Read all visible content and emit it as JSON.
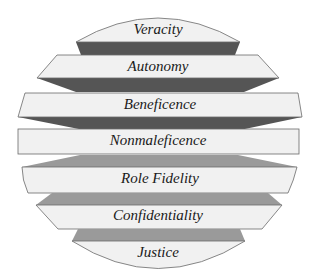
{
  "diagram": {
    "layers": [
      {
        "id": "veracity",
        "label": "Veracity"
      },
      {
        "id": "autonomy",
        "label": "Autonomy"
      },
      {
        "id": "beneficence",
        "label": "Beneficence"
      },
      {
        "id": "nonmaleficence",
        "label": "Nonmaleficence"
      },
      {
        "id": "role-fidelity",
        "label": "Role Fidelity"
      },
      {
        "id": "confidentiality",
        "label": "Confidentiality"
      },
      {
        "id": "justice",
        "label": "Justice"
      }
    ],
    "colors": {
      "face": "#f1f1f1",
      "upper_shadow": "#555555",
      "lower_shadow": "#9a9a9a",
      "outline": "#6a6a6a"
    }
  }
}
